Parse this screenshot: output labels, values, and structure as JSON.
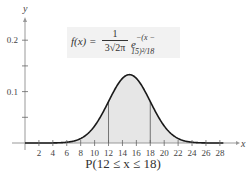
{
  "chart_data": {
    "type": "area",
    "title": "",
    "function_label": "f(x) = 1/(3√(2π)) e^(−(x − 15)²/18)",
    "distribution": {
      "mean": 15,
      "std_dev": 3
    },
    "shaded_interval": [
      12,
      18
    ],
    "caption": "P(12 ≤ x ≤ 18)",
    "xlabel": "x",
    "ylabel": "y",
    "xlim": [
      0,
      29
    ],
    "ylim": [
      0,
      0.22
    ],
    "x_ticks": [
      2,
      4,
      6,
      8,
      10,
      12,
      14,
      16,
      18,
      20,
      22,
      24,
      26,
      28
    ],
    "y_ticks": [
      0.05,
      0.1,
      0.15,
      0.2
    ],
    "y_tick_labels": [
      "0.1",
      "0.2"
    ],
    "peak": {
      "x": 15,
      "y": 0.133
    },
    "sample_points": {
      "x": [
        0,
        3,
        6,
        9,
        12,
        15,
        18,
        21,
        24,
        27,
        29
      ],
      "y": [
        0.0,
        0.0001,
        0.0015,
        0.018,
        0.081,
        0.133,
        0.081,
        0.018,
        0.0015,
        0.0001,
        0.0
      ]
    },
    "grid": false,
    "legend": null
  },
  "formula": {
    "lhs": "f(x) =",
    "numerator": "1",
    "denominator": "3√2π",
    "base": "e",
    "exponent": "−(x − 15)²/18"
  },
  "axis": {
    "x_label": "x",
    "y_label": "y",
    "x_tick_labels": [
      "2",
      "4",
      "6",
      "8",
      "10",
      "12",
      "14",
      "16",
      "18",
      "20",
      "22",
      "24",
      "26",
      "28"
    ],
    "y_tick_labels": [
      "0.1",
      "0.2"
    ]
  },
  "caption": "P(12 ≤ x ≤ 18)",
  "colors": {
    "curve": "#1a1a1a",
    "fill": "#e6e6e6",
    "axis": "#999999",
    "box": "#f2f2f2"
  }
}
